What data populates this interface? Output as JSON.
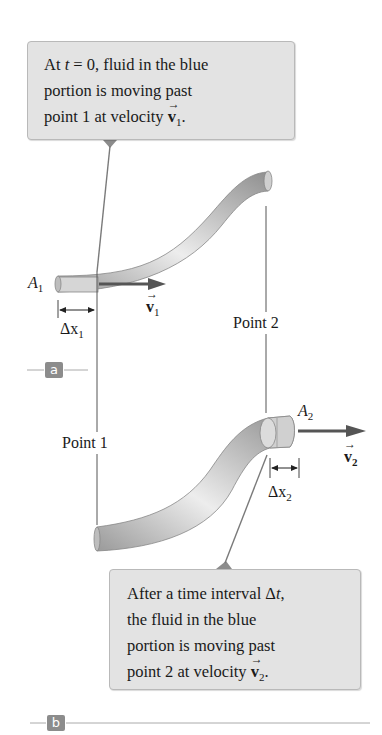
{
  "callouts": {
    "top": {
      "line1_pre": "At ",
      "line1_var": "t",
      "line1_post": " = 0, fluid in the blue",
      "line2": "portion is moving past",
      "line3_pre": "point 1 at velocity ",
      "line3_vec": "v",
      "line3_sub": "1",
      "line3_post": "."
    },
    "bottom": {
      "line1_pre": "After a time interval Δ",
      "line1_var": "t",
      "line1_post": ",",
      "line2": "the fluid in the blue",
      "line3": "portion is moving past",
      "line4_pre": "point 2 at velocity ",
      "line4_vec": "v",
      "line4_sub": "2",
      "line4_post": "."
    }
  },
  "labels": {
    "A1": {
      "main": "A",
      "sub": "1"
    },
    "A2": {
      "main": "A",
      "sub": "2"
    },
    "v1": {
      "main": "v",
      "sub": "1"
    },
    "v2": {
      "main": "v",
      "sub": "2"
    },
    "dx1": {
      "main": "Δx",
      "sub": "1"
    },
    "dx2": {
      "main": "Δx",
      "sub": "2"
    },
    "point1": "Point 1",
    "point2": "Point 2"
  },
  "panels": {
    "a": "a",
    "b": "b"
  },
  "colors": {
    "callout_bg": "#e3e3e3",
    "tube": "#c8c8c8",
    "arrow": "#555555",
    "tag": "#8c8c8c"
  }
}
